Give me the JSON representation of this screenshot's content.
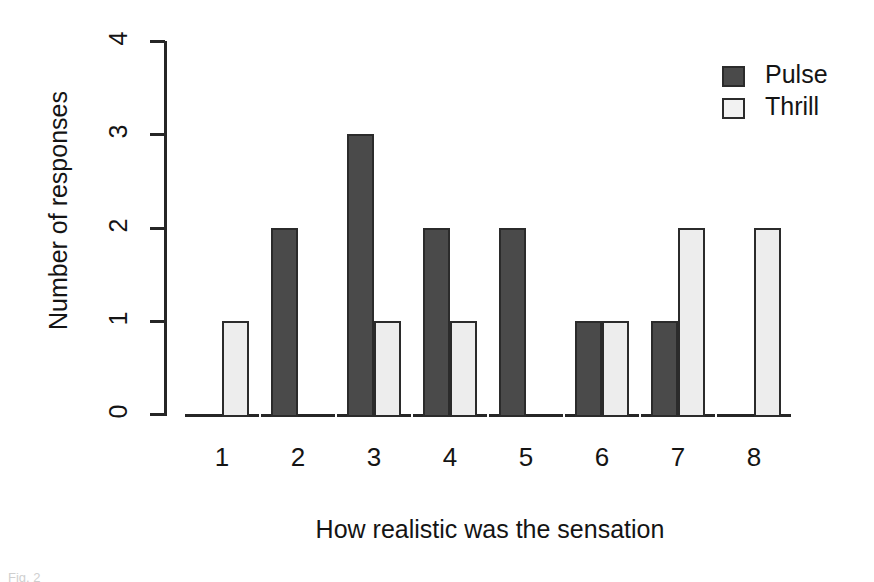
{
  "chart_data": {
    "type": "bar",
    "title": "",
    "xlabel": "How realistic was the sensation",
    "ylabel": "Number of responses",
    "categories": [
      "1",
      "2",
      "3",
      "4",
      "5",
      "6",
      "7",
      "8"
    ],
    "series": [
      {
        "name": "Pulse",
        "color": "#4a4a4a",
        "values": [
          0,
          2,
          3,
          2,
          2,
          1,
          1,
          0
        ]
      },
      {
        "name": "Thrill",
        "color": "#ededed",
        "values": [
          1,
          0,
          1,
          1,
          0,
          1,
          2,
          2
        ]
      }
    ],
    "ylim": [
      0,
      4
    ],
    "yticks": [
      "0",
      "1",
      "2",
      "3",
      "4"
    ],
    "grid": false,
    "legend_position": "top-right",
    "grouping": "grouped"
  },
  "axes": {
    "y_title": "Number of responses",
    "x_title": "How realistic was the sensation",
    "y_tick_labels": [
      "0",
      "1",
      "2",
      "3",
      "4"
    ],
    "x_tick_labels": [
      "1",
      "2",
      "3",
      "4",
      "5",
      "6",
      "7",
      "8"
    ]
  },
  "legend": {
    "entries": [
      {
        "label": "Pulse",
        "swatch": "filled-dark-square"
      },
      {
        "label": "Thrill",
        "swatch": "outlined-light-square"
      }
    ]
  },
  "caption": {
    "sliver_text": "Fig. 2"
  },
  "colors": {
    "pulse_fill": "#4a4a4a",
    "thrill_fill": "#ededed",
    "outline": "#2b2b2b",
    "text": "#141414",
    "background": "#ffffff"
  }
}
